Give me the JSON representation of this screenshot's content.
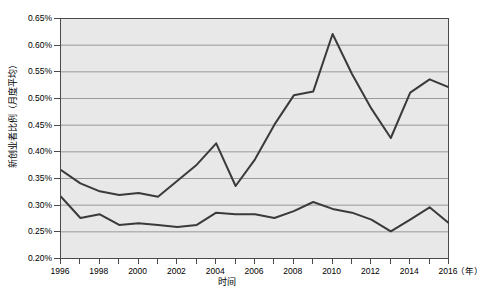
{
  "chart_data": {
    "type": "line",
    "title": "",
    "xlabel": "时间",
    "x_unit": "（年）",
    "ylabel": "新创业者比例（月度平均）",
    "xlim": [
      1996,
      2016
    ],
    "ylim": [
      0.2,
      0.65
    ],
    "y_tick_suffix": "%",
    "grid": true,
    "legend": "none",
    "background": "#e8e8e8",
    "line_color": "#3a3a3a",
    "grid_color": "#9a9a9a",
    "axis_color": "#4a4a4a",
    "x_tick_labels": [
      "1996",
      "1998",
      "2000",
      "2002",
      "2004",
      "2006",
      "2008",
      "2010",
      "2012",
      "2014",
      "2016"
    ],
    "y_tick_labels": [
      "0.20%",
      "0.25%",
      "0.30%",
      "0.35%",
      "0.40%",
      "0.45%",
      "0.50%",
      "0.55%",
      "0.60%",
      "0.65%"
    ],
    "y_tick_values": [
      0.2,
      0.25,
      0.3,
      0.35,
      0.4,
      0.45,
      0.5,
      0.55,
      0.6,
      0.65
    ],
    "x": [
      1996,
      1997,
      1998,
      1999,
      2000,
      2001,
      2002,
      2003,
      2004,
      2005,
      2006,
      2007,
      2008,
      2009,
      2010,
      2011,
      2012,
      2013,
      2014,
      2015,
      2016
    ],
    "series": [
      {
        "name": "上线",
        "values": [
          0.365,
          0.34,
          0.325,
          0.318,
          0.322,
          0.315,
          0.345,
          0.375,
          0.415,
          0.335,
          0.385,
          0.45,
          0.505,
          0.512,
          0.62,
          0.545,
          0.48,
          0.425,
          0.51,
          0.535,
          0.52
        ]
      },
      {
        "name": "下线",
        "values": [
          0.315,
          0.275,
          0.282,
          0.262,
          0.265,
          0.262,
          0.258,
          0.262,
          0.285,
          0.282,
          0.282,
          0.275,
          0.288,
          0.305,
          0.292,
          0.285,
          0.272,
          0.25,
          0.272,
          0.295,
          0.265
        ]
      }
    ]
  }
}
